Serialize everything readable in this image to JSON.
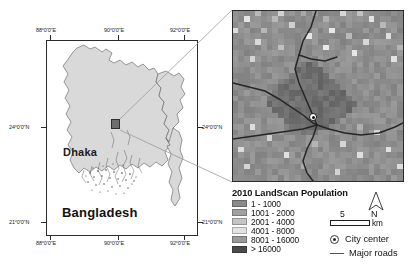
{
  "figure": {
    "type": "map-figure",
    "background": "#ffffff"
  },
  "overview_map": {
    "name": "bangladesh-overview-map",
    "country_label": "Bangladesh",
    "city_label": "Dhaka",
    "land_fill": "#d9d9d9",
    "land_stroke": "#6b6b6b",
    "frame_stroke": "#2b2b2b",
    "lon_ticks_top": [
      "88°0'0\"E",
      "90°0'0\"E",
      "92°0'0\"E"
    ],
    "lon_ticks_bottom": [
      "88°0'0\"E",
      "90°0'0\"E",
      "92°0'0\"E"
    ],
    "lat_ticks_left": [
      "24°0'0\"N",
      "21°0'0\"N"
    ],
    "lat_ticks_right": [
      "24°0'0\"N",
      "21°0'0\"N"
    ],
    "dhaka_marker": "dhaka-extent-box"
  },
  "inset_map": {
    "name": "dhaka-landscan-raster-inset",
    "city_center_marker": "city-center-dot",
    "road_color": "#2a2a2a",
    "border_color": "#2b2b2b"
  },
  "legend": {
    "title": "2010 LandScan Population",
    "classes": [
      {
        "label": "1 - 1000",
        "color": "#8a8a8a"
      },
      {
        "label": "1001 - 2000",
        "color": "#a0a0a0"
      },
      {
        "label": "2001 - 4000",
        "color": "#c4c4c4"
      },
      {
        "label": "4001 - 8000",
        "color": "#e2e2e2"
      },
      {
        "label": "8001 - 16000",
        "color": "#9a9a9a"
      },
      {
        "label": "> 16000",
        "color": "#4a4a4a"
      }
    ],
    "symbols": [
      {
        "name": "city-center",
        "label": "City center"
      },
      {
        "name": "major-roads",
        "label": "Major roads"
      }
    ]
  },
  "scale_bar": {
    "value": "5",
    "unit": "km"
  },
  "north_arrow": {
    "label": "N"
  },
  "chart_data": {
    "type": "heatmap",
    "title": "2010 LandScan Population",
    "legend_classes": [
      "1 - 1000",
      "1001 - 2000",
      "2001 - 4000",
      "4001 - 8000",
      "8001 - 16000",
      "> 16000"
    ],
    "class_colors": [
      "#8a8a8a",
      "#a0a0a0",
      "#c4c4c4",
      "#e2e2e2",
      "#9a9a9a",
      "#4a4a4a"
    ],
    "grid_cols": 30,
    "grid_rows": 30,
    "cells": [
      [
        1,
        1,
        1,
        1,
        2,
        1,
        1,
        1,
        3,
        1,
        1,
        1,
        2,
        1,
        1,
        1,
        1,
        1,
        1,
        3,
        1,
        1,
        2,
        1,
        1,
        1,
        1,
        1,
        1,
        1
      ],
      [
        1,
        1,
        3,
        1,
        1,
        1,
        1,
        2,
        1,
        1,
        1,
        1,
        1,
        1,
        1,
        1,
        2,
        1,
        1,
        1,
        1,
        1,
        1,
        1,
        3,
        1,
        1,
        1,
        1,
        1
      ],
      [
        1,
        1,
        1,
        1,
        1,
        1,
        1,
        1,
        1,
        1,
        3,
        1,
        1,
        1,
        1,
        1,
        1,
        1,
        1,
        1,
        1,
        1,
        1,
        1,
        1,
        1,
        2,
        1,
        1,
        1
      ],
      [
        3,
        1,
        1,
        1,
        1,
        2,
        1,
        1,
        1,
        1,
        1,
        1,
        1,
        1,
        1,
        1,
        1,
        3,
        1,
        1,
        1,
        1,
        1,
        1,
        1,
        1,
        1,
        1,
        1,
        1
      ],
      [
        1,
        1,
        1,
        1,
        1,
        1,
        1,
        1,
        1,
        1,
        1,
        1,
        1,
        3,
        1,
        1,
        1,
        1,
        1,
        1,
        2,
        1,
        1,
        1,
        1,
        1,
        1,
        3,
        1,
        1
      ],
      [
        1,
        1,
        1,
        1,
        3,
        1,
        1,
        1,
        1,
        1,
        1,
        1,
        1,
        1,
        1,
        1,
        1,
        1,
        1,
        1,
        1,
        1,
        1,
        3,
        1,
        1,
        1,
        1,
        1,
        1
      ],
      [
        1,
        1,
        1,
        1,
        1,
        1,
        1,
        1,
        2,
        1,
        1,
        1,
        1,
        1,
        1,
        1,
        3,
        1,
        1,
        1,
        1,
        1,
        1,
        1,
        1,
        1,
        1,
        1,
        1,
        2
      ],
      [
        1,
        1,
        1,
        1,
        1,
        1,
        1,
        1,
        1,
        1,
        1,
        1,
        1,
        1,
        1,
        1,
        1,
        1,
        1,
        1,
        1,
        3,
        1,
        1,
        1,
        1,
        1,
        1,
        1,
        1
      ],
      [
        1,
        1,
        1,
        3,
        1,
        1,
        1,
        1,
        1,
        1,
        1,
        1,
        1,
        1,
        1,
        1,
        1,
        1,
        1,
        1,
        1,
        1,
        1,
        1,
        1,
        1,
        1,
        1,
        3,
        1
      ],
      [
        1,
        1,
        1,
        1,
        1,
        1,
        1,
        1,
        1,
        1,
        1,
        1,
        0,
        0,
        0,
        1,
        1,
        1,
        1,
        1,
        1,
        1,
        1,
        1,
        1,
        1,
        1,
        1,
        1,
        1
      ],
      [
        1,
        1,
        1,
        1,
        1,
        1,
        1,
        1,
        1,
        1,
        1,
        0,
        0,
        0,
        0,
        0,
        1,
        1,
        1,
        1,
        1,
        1,
        1,
        1,
        1,
        1,
        1,
        1,
        1,
        1
      ],
      [
        1,
        1,
        1,
        1,
        1,
        1,
        1,
        1,
        1,
        1,
        0,
        0,
        0,
        0,
        0,
        0,
        0,
        1,
        1,
        1,
        1,
        1,
        1,
        1,
        1,
        1,
        1,
        1,
        1,
        1
      ],
      [
        1,
        1,
        1,
        1,
        1,
        1,
        1,
        1,
        1,
        0,
        0,
        0,
        0,
        0,
        0,
        0,
        0,
        0,
        1,
        1,
        1,
        1,
        1,
        1,
        1,
        1,
        1,
        1,
        1,
        1
      ],
      [
        1,
        1,
        1,
        1,
        1,
        1,
        1,
        1,
        0,
        0,
        0,
        0,
        0,
        0,
        0,
        0,
        0,
        0,
        0,
        1,
        1,
        1,
        1,
        1,
        1,
        1,
        1,
        1,
        1,
        1
      ],
      [
        1,
        1,
        1,
        1,
        1,
        1,
        1,
        0,
        0,
        0,
        0,
        0,
        0,
        0,
        0,
        0,
        0,
        0,
        0,
        0,
        1,
        1,
        1,
        1,
        1,
        1,
        1,
        1,
        1,
        1
      ],
      [
        1,
        1,
        1,
        1,
        1,
        1,
        0,
        0,
        0,
        0,
        0,
        0,
        0,
        0,
        0,
        0,
        0,
        0,
        0,
        0,
        0,
        1,
        1,
        1,
        1,
        1,
        1,
        1,
        1,
        1
      ],
      [
        1,
        1,
        1,
        1,
        1,
        1,
        0,
        0,
        0,
        0,
        0,
        0,
        0,
        0,
        0,
        0,
        0,
        0,
        0,
        0,
        0,
        0,
        1,
        1,
        1,
        1,
        1,
        1,
        1,
        1
      ],
      [
        1,
        1,
        1,
        1,
        1,
        1,
        1,
        0,
        0,
        0,
        0,
        0,
        0,
        0,
        0,
        0,
        0,
        0,
        0,
        0,
        0,
        1,
        1,
        1,
        1,
        1,
        1,
        1,
        1,
        1
      ],
      [
        1,
        1,
        1,
        1,
        1,
        1,
        1,
        1,
        0,
        0,
        0,
        0,
        0,
        0,
        0,
        0,
        0,
        0,
        0,
        0,
        1,
        1,
        1,
        1,
        1,
        1,
        1,
        1,
        1,
        1
      ],
      [
        1,
        1,
        1,
        1,
        1,
        1,
        1,
        1,
        1,
        0,
        0,
        0,
        0,
        0,
        0,
        0,
        0,
        0,
        0,
        1,
        1,
        1,
        1,
        1,
        1,
        1,
        1,
        1,
        1,
        1
      ],
      [
        1,
        1,
        1,
        3,
        1,
        1,
        1,
        1,
        1,
        1,
        0,
        0,
        0,
        0,
        0,
        0,
        0,
        1,
        1,
        1,
        1,
        1,
        2,
        1,
        1,
        1,
        1,
        1,
        1,
        1
      ],
      [
        1,
        1,
        1,
        1,
        1,
        1,
        1,
        1,
        1,
        1,
        1,
        1,
        0,
        0,
        0,
        1,
        1,
        1,
        1,
        1,
        1,
        1,
        1,
        1,
        1,
        3,
        1,
        1,
        1,
        1
      ],
      [
        1,
        1,
        1,
        1,
        1,
        1,
        3,
        1,
        1,
        1,
        1,
        1,
        1,
        1,
        1,
        1,
        1,
        1,
        1,
        1,
        1,
        1,
        1,
        1,
        1,
        1,
        1,
        1,
        1,
        1
      ],
      [
        1,
        1,
        1,
        1,
        1,
        1,
        1,
        1,
        1,
        1,
        1,
        1,
        1,
        1,
        2,
        1,
        1,
        1,
        1,
        3,
        1,
        1,
        1,
        1,
        1,
        1,
        1,
        1,
        1,
        1
      ],
      [
        1,
        3,
        1,
        1,
        1,
        1,
        1,
        1,
        1,
        1,
        1,
        1,
        1,
        1,
        1,
        1,
        1,
        1,
        1,
        1,
        1,
        1,
        1,
        1,
        1,
        1,
        1,
        3,
        1,
        1
      ],
      [
        1,
        1,
        1,
        1,
        1,
        1,
        1,
        1,
        1,
        3,
        1,
        1,
        1,
        1,
        1,
        1,
        1,
        1,
        1,
        1,
        1,
        1,
        3,
        1,
        1,
        1,
        1,
        1,
        1,
        1
      ],
      [
        1,
        1,
        1,
        1,
        1,
        1,
        1,
        1,
        1,
        1,
        1,
        1,
        1,
        1,
        1,
        1,
        1,
        1,
        1,
        1,
        1,
        1,
        1,
        1,
        1,
        1,
        1,
        1,
        1,
        1
      ],
      [
        1,
        1,
        3,
        1,
        1,
        1,
        1,
        1,
        1,
        1,
        1,
        1,
        2,
        1,
        1,
        1,
        1,
        1,
        1,
        1,
        1,
        1,
        1,
        1,
        1,
        1,
        1,
        1,
        1,
        3
      ],
      [
        1,
        1,
        1,
        1,
        1,
        1,
        1,
        1,
        1,
        1,
        1,
        1,
        1,
        1,
        1,
        1,
        1,
        1,
        3,
        1,
        1,
        1,
        1,
        1,
        1,
        1,
        1,
        1,
        1,
        1
      ],
      [
        1,
        1,
        1,
        1,
        1,
        1,
        1,
        1,
        1,
        1,
        1,
        1,
        1,
        1,
        1,
        1,
        1,
        1,
        1,
        1,
        1,
        1,
        1,
        1,
        1,
        1,
        1,
        1,
        1,
        1
      ]
    ]
  }
}
